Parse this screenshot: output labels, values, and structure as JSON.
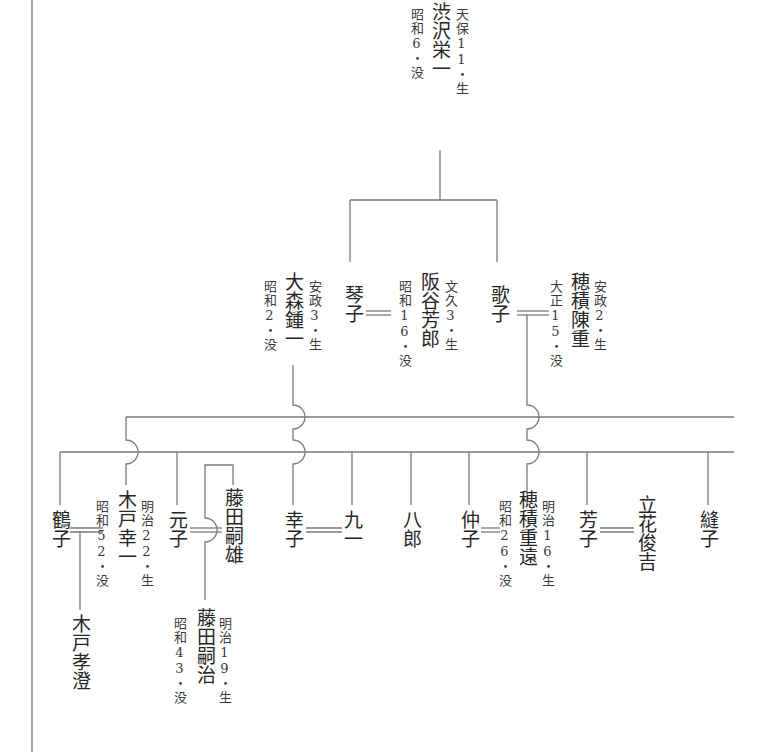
{
  "diagram": {
    "type": "genealogy-tree",
    "colors": {
      "line": "#7a7a7a",
      "text": "#262626",
      "background": "#ffffff"
    },
    "people": {
      "shibusawa_eiichi": {
        "name": "渋沢栄一",
        "born": "天保11・生",
        "died": "昭和6・没"
      },
      "kotoko": {
        "name": "琴子"
      },
      "sakatani_yoshiro": {
        "name": "阪谷芳郎",
        "born": "文久3・生",
        "died": "昭和16・没"
      },
      "utako": {
        "name": "歌子"
      },
      "hozumi_nobushige": {
        "name": "穂積陳重",
        "born": "安政2・生",
        "died": "大正15・没"
      },
      "omori_shoichi": {
        "name": "大森鍾一",
        "born": "安政3・生",
        "died": "昭和2・没"
      },
      "tsuruko": {
        "name": "鶴子"
      },
      "kido_koichi": {
        "name": "木戸幸一",
        "born": "明治22・生",
        "died": "昭和52・没"
      },
      "motoko": {
        "name": "元子"
      },
      "fujita_tsuguo": {
        "name": "藤田嗣雄"
      },
      "sachiko": {
        "name": "幸子"
      },
      "kuichi": {
        "name": "九一"
      },
      "hachiro": {
        "name": "八郎"
      },
      "nakako": {
        "name": "仲子"
      },
      "hozumi_shigeto": {
        "name": "穂積重遠",
        "born": "明治16・生",
        "died": "昭和26・没"
      },
      "yoshiko": {
        "name": "芳子"
      },
      "tachibana_shunkichi": {
        "name": "立花俊吉"
      },
      "nuiko": {
        "name": "縫子"
      },
      "kido_takazumi": {
        "name": "木戸孝澄"
      },
      "fujita_tsuguharu": {
        "name": "藤田嗣治",
        "born": "明治19・生",
        "died": "昭和43・没"
      }
    },
    "marriages": [
      [
        "kotoko",
        "sakatani_yoshiro"
      ],
      [
        "utako",
        "hozumi_nobushige"
      ],
      [
        "tsuruko",
        "kido_koichi"
      ],
      [
        "motoko",
        "fujita_tsuguo"
      ],
      [
        "sachiko",
        "kuichi"
      ],
      [
        "nakako",
        "hozumi_shigeto"
      ],
      [
        "yoshiko",
        "tachibana_shunkichi"
      ]
    ],
    "parent_child": [
      [
        "shibusawa_eiichi",
        "kotoko"
      ],
      [
        "shibusawa_eiichi",
        "utako"
      ],
      [
        "omori_shoichi",
        "sachiko"
      ],
      [
        "utako+hozumi_nobushige",
        "hozumi_shigeto"
      ],
      [
        "tsuruko+kido_koichi",
        "kido_takazumi"
      ]
    ]
  }
}
